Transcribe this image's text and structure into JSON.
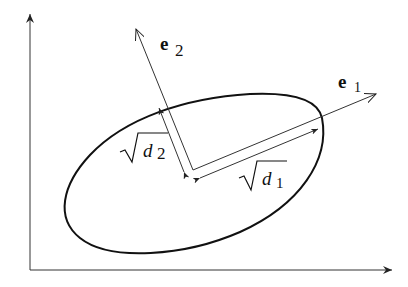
{
  "diagram": {
    "axes": {
      "x_axis": "horizontal axis",
      "y_axis": "vertical axis"
    },
    "vectors": [
      {
        "name": "e1",
        "label_main": "e",
        "label_sub": "1"
      },
      {
        "name": "e2",
        "label_main": "e",
        "label_sub": "2"
      }
    ],
    "lengths": [
      {
        "name": "sqrt-d1",
        "label_main": "d",
        "label_sub": "1"
      },
      {
        "name": "sqrt-d2",
        "label_main": "d",
        "label_sub": "2"
      }
    ],
    "colors": {
      "stroke": "#222222",
      "background": "#ffffff"
    }
  }
}
